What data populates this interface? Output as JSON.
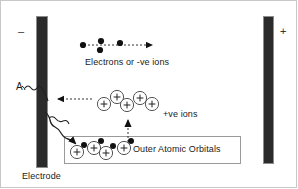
{
  "diagram": {
    "background_color": "#ffffff",
    "frame_color": "#c8c8c8",
    "electrode_color": "#2b2b2b",
    "labels": {
      "negative_sign": "–",
      "positive_sign": "+",
      "current_symbol": "A",
      "electrons_label": "Electrons or -ve ions",
      "positive_ions_label": "+ve   ions",
      "outer_orbitals_label": "Outer Atomic Orbitals",
      "electrode_label": "Electrode",
      "ion_charge_glyph": "+"
    },
    "electrodes": [
      {
        "name": "cathode",
        "polarity": "–",
        "x": 36,
        "y": 16,
        "width": 12,
        "height": 152
      },
      {
        "name": "anode",
        "polarity": "+",
        "x": 263,
        "y": 16,
        "width": 11,
        "height": 148
      }
    ],
    "electrons": [
      {
        "x": 83,
        "y": 45
      },
      {
        "x": 101,
        "y": 41
      },
      {
        "x": 100,
        "y": 50
      },
      {
        "x": 120,
        "y": 43
      }
    ],
    "free_ions": [
      {
        "x": 104,
        "y": 104
      },
      {
        "x": 117,
        "y": 97
      },
      {
        "x": 127,
        "y": 105
      },
      {
        "x": 140,
        "y": 98
      },
      {
        "x": 152,
        "y": 104
      }
    ],
    "bound_ions": [
      {
        "x": 77,
        "y": 152,
        "electron_dx": 7,
        "electron_dy": -7
      },
      {
        "x": 94,
        "y": 148,
        "electron_dx": 7,
        "electron_dy": -7
      },
      {
        "x": 106,
        "y": 153,
        "electron_dx": 7,
        "electron_dy": -7
      },
      {
        "x": 124,
        "y": 148,
        "electron_dx": 7,
        "electron_dy": -7
      }
    ],
    "arrows": [
      {
        "name": "electron-flow-arrow",
        "type": "dashed",
        "direction": "right",
        "from": [
          84,
          45
        ],
        "to": [
          158,
          45
        ]
      },
      {
        "name": "electron-into-electrode-arrow",
        "type": "dashed",
        "direction": "left",
        "from": [
          92,
          99
        ],
        "to": [
          52,
          99
        ]
      },
      {
        "name": "ion-release-arrow",
        "type": "dashed",
        "direction": "up",
        "from": [
          128,
          142
        ],
        "to": [
          128,
          114
        ]
      },
      {
        "name": "current-squiggle-upper",
        "type": "wavy",
        "from": [
          26,
          90
        ],
        "to": [
          44,
          104
        ]
      },
      {
        "name": "current-squiggle-lower",
        "type": "wavy",
        "from": [
          44,
          112
        ],
        "to": [
          86,
          143
        ]
      }
    ],
    "orbital_box": {
      "x": 64,
      "y": 136,
      "width": 177,
      "height": 28
    }
  }
}
